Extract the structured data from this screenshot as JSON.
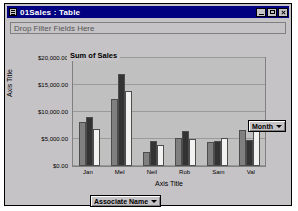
{
  "window": {
    "title": "01Sales : Table",
    "sys_icon": "table-icon",
    "buttons": [
      {
        "name": "minimize",
        "glyph": "minimize-icon"
      },
      {
        "name": "maximize",
        "glyph": "maximize-icon"
      },
      {
        "name": "close",
        "glyph": "close-icon"
      }
    ]
  },
  "filter_bar": {
    "placeholder": "Drop Filter Fields Here"
  },
  "field_buttons": {
    "series_field": "Month",
    "category_field": "Associate Name",
    "caret_icon": "chevron-down-icon"
  },
  "chart_data": {
    "type": "bar",
    "title": "Sum of Sales",
    "xlabel": "Axis Title",
    "ylabel": "Axis Title",
    "categories": [
      "Jan",
      "Mel",
      "Neil",
      "Rob",
      "Sam",
      "Val"
    ],
    "series": [
      {
        "name": "Month 1",
        "color": "#808080",
        "values": [
          8200,
          12400,
          2600,
          5200,
          4400,
          6600
        ]
      },
      {
        "name": "Month 2",
        "color": "#333333",
        "values": [
          9000,
          17000,
          4600,
          6400,
          4700,
          4900
        ]
      },
      {
        "name": "Month 3",
        "color": "#f2f2f0",
        "values": [
          6900,
          13900,
          3900,
          5000,
          5100,
          7400
        ]
      }
    ],
    "ylim": [
      0,
      20000
    ],
    "yticks": [
      0,
      5000,
      10000,
      15000,
      20000
    ],
    "ytick_labels": [
      "$0.00",
      "$5,000.00",
      "$10,000.00",
      "$15,000.00",
      "$20,000.00"
    ],
    "grid": true,
    "legend": false,
    "plot_background": "#c0c0c0"
  }
}
